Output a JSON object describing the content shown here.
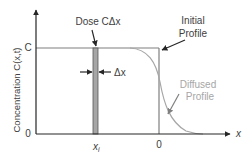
{
  "diagram": {
    "type": "diffusion-profile",
    "y_axis": {
      "label": "Concentration C(x,t)",
      "ticks": [
        "C",
        "0"
      ]
    },
    "x_axis": {
      "label": "x",
      "ticks": [
        "x_i",
        "0"
      ],
      "tick_main": "x",
      "tick_sub": "i",
      "origin_label": "0"
    },
    "annotations": {
      "dose": "Dose CΔx",
      "delta_x": "Δx",
      "initial_profile_line1": "Initial",
      "initial_profile_line2": "Profile",
      "diffused_profile_line1": "Diffused",
      "diffused_profile_line2": "Profile"
    },
    "colors": {
      "axis": "#262626",
      "initial_profile": "#7f7f7f",
      "diffused_profile": "#a6a6a6",
      "slab_fill": "#a6a6a6",
      "text": "#404040",
      "text_muted": "#a6a6a6"
    }
  }
}
